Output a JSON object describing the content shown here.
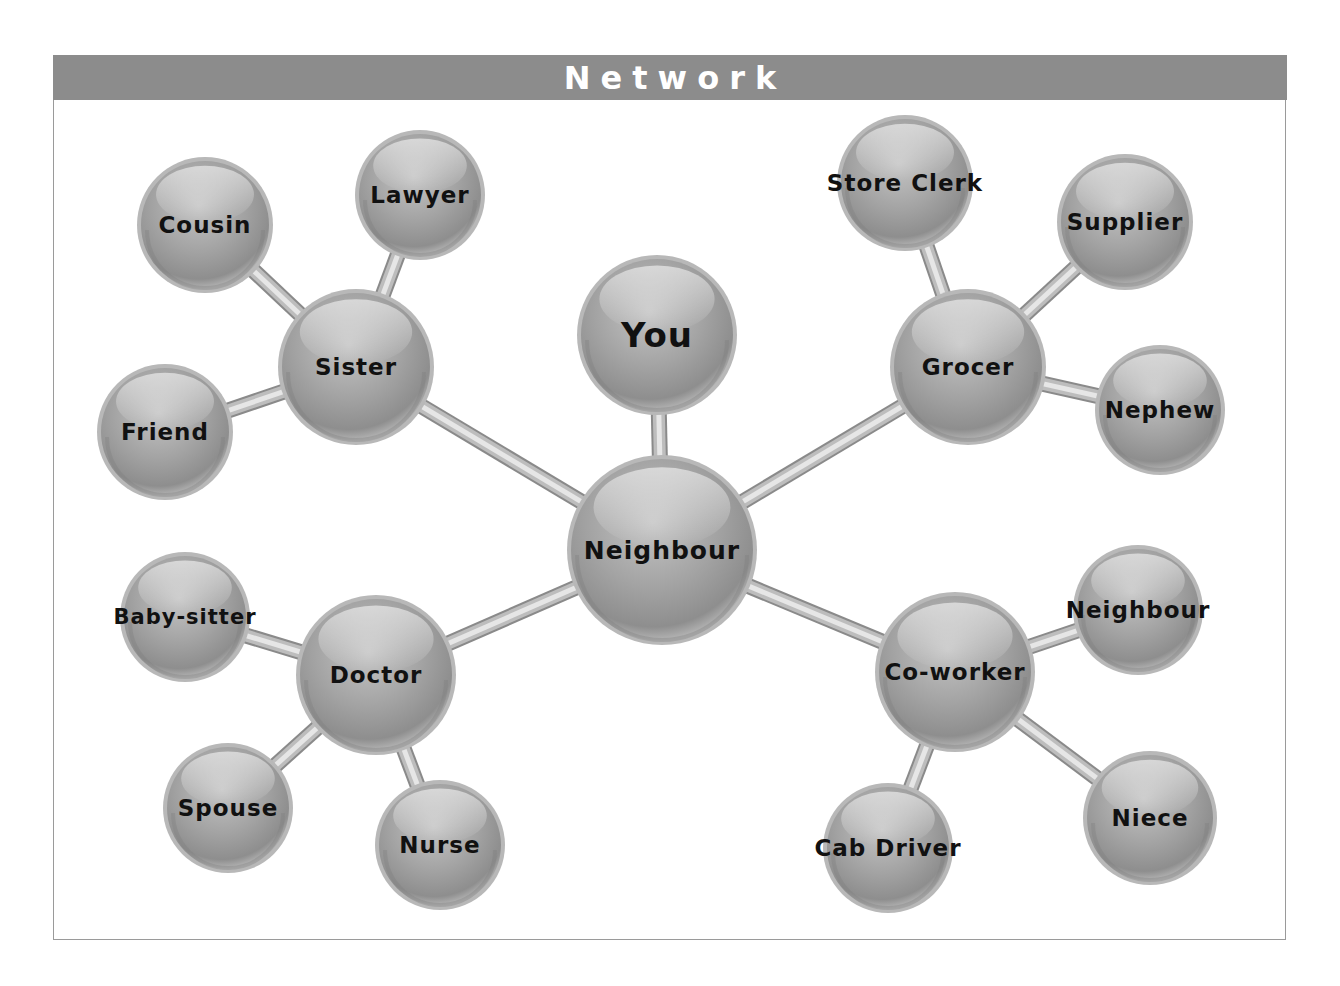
{
  "header": {
    "title": "Network"
  },
  "colors": {
    "header_bg": "#8c8c8c",
    "sphere_fill": "#9e9e9e",
    "sphere_highlight": "#d8d8d8",
    "connector": "#a8a8a8",
    "label": "#111111",
    "frame_border": "#9a9a9a"
  },
  "nodes": [
    {
      "id": "you",
      "label": "You",
      "x": 657,
      "y": 335,
      "r": 80,
      "size": 34
    },
    {
      "id": "neighbour_center",
      "label": "Neighbour",
      "x": 662,
      "y": 550,
      "r": 95,
      "size": 25
    },
    {
      "id": "sister",
      "label": "Sister",
      "x": 356,
      "y": 367,
      "r": 78,
      "size": 23
    },
    {
      "id": "cousin",
      "label": "Cousin",
      "x": 205,
      "y": 225,
      "r": 68,
      "size": 23
    },
    {
      "id": "lawyer",
      "label": "Lawyer",
      "x": 420,
      "y": 195,
      "r": 65,
      "size": 23
    },
    {
      "id": "friend",
      "label": "Friend",
      "x": 165,
      "y": 432,
      "r": 68,
      "size": 23
    },
    {
      "id": "grocer",
      "label": "Grocer",
      "x": 968,
      "y": 367,
      "r": 78,
      "size": 23
    },
    {
      "id": "store_clerk",
      "label": "Store Clerk",
      "x": 905,
      "y": 183,
      "r": 68,
      "size": 23
    },
    {
      "id": "supplier",
      "label": "Supplier",
      "x": 1125,
      "y": 222,
      "r": 68,
      "size": 23
    },
    {
      "id": "nephew",
      "label": "Nephew",
      "x": 1160,
      "y": 410,
      "r": 65,
      "size": 23
    },
    {
      "id": "doctor",
      "label": "Doctor",
      "x": 376,
      "y": 675,
      "r": 80,
      "size": 23
    },
    {
      "id": "baby_sitter",
      "label": "Baby-sitter",
      "x": 185,
      "y": 617,
      "r": 65,
      "size": 21
    },
    {
      "id": "spouse",
      "label": "Spouse",
      "x": 228,
      "y": 808,
      "r": 65,
      "size": 23
    },
    {
      "id": "nurse",
      "label": "Nurse",
      "x": 440,
      "y": 845,
      "r": 65,
      "size": 23
    },
    {
      "id": "co_worker",
      "label": "Co-worker",
      "x": 955,
      "y": 672,
      "r": 80,
      "size": 23
    },
    {
      "id": "neighbour_right",
      "label": "Neighbour",
      "x": 1138,
      "y": 610,
      "r": 65,
      "size": 23
    },
    {
      "id": "cab_driver",
      "label": "Cab Driver",
      "x": 888,
      "y": 848,
      "r": 65,
      "size": 23
    },
    {
      "id": "niece",
      "label": "Niece",
      "x": 1150,
      "y": 818,
      "r": 67,
      "size": 23
    }
  ],
  "edges": [
    [
      "you",
      "neighbour_center"
    ],
    [
      "neighbour_center",
      "sister"
    ],
    [
      "neighbour_center",
      "grocer"
    ],
    [
      "neighbour_center",
      "doctor"
    ],
    [
      "neighbour_center",
      "co_worker"
    ],
    [
      "sister",
      "cousin"
    ],
    [
      "sister",
      "lawyer"
    ],
    [
      "sister",
      "friend"
    ],
    [
      "grocer",
      "store_clerk"
    ],
    [
      "grocer",
      "supplier"
    ],
    [
      "grocer",
      "nephew"
    ],
    [
      "doctor",
      "baby_sitter"
    ],
    [
      "doctor",
      "spouse"
    ],
    [
      "doctor",
      "nurse"
    ],
    [
      "co_worker",
      "neighbour_right"
    ],
    [
      "co_worker",
      "cab_driver"
    ],
    [
      "co_worker",
      "niece"
    ]
  ]
}
